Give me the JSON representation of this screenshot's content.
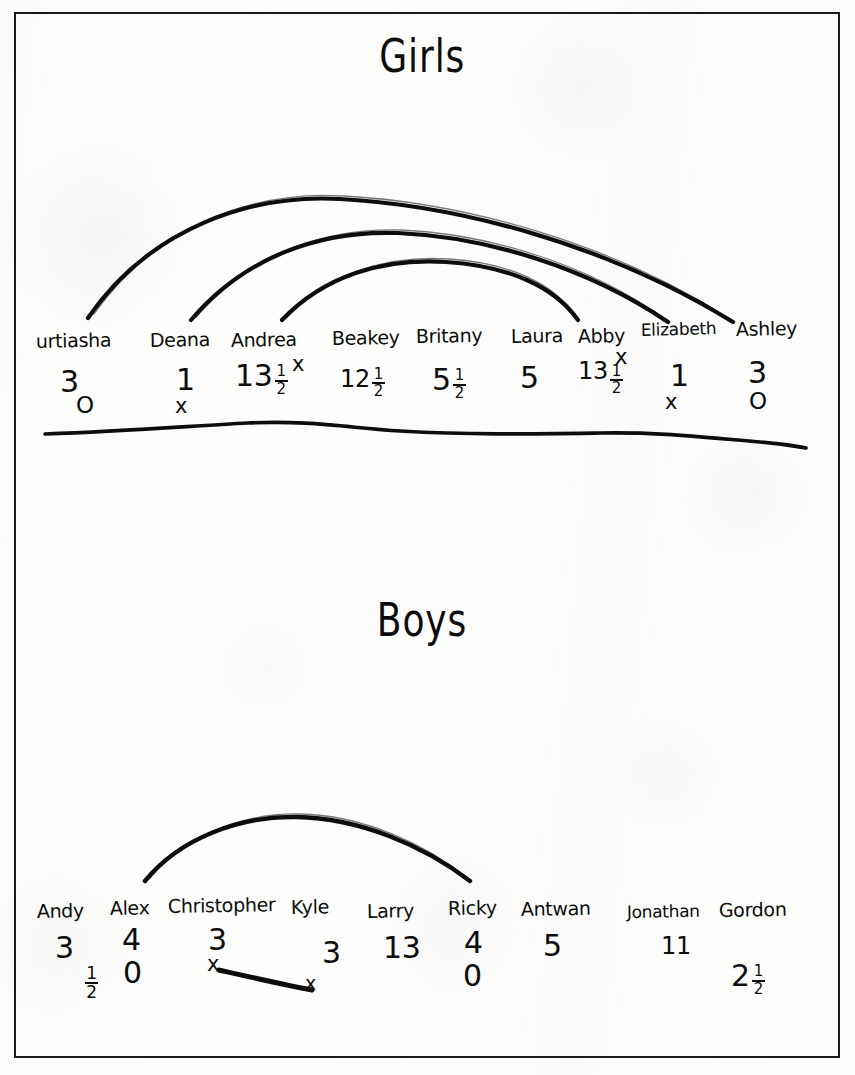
{
  "document": {
    "kind": "handwritten-worksheet",
    "ink_color": "#0d0d0d",
    "paper_color": "#fdfdfc"
  },
  "girls": {
    "title": "Girls",
    "students": [
      {
        "name": "urtiasha",
        "value": "3",
        "fraction": null,
        "below": "O",
        "mark": null
      },
      {
        "name": "Deana",
        "value": "1",
        "fraction": null,
        "below": "x",
        "mark": null
      },
      {
        "name": "Andrea",
        "value": "13",
        "fraction": "1/2",
        "below": null,
        "mark": "x"
      },
      {
        "name": "Beakey",
        "value": "12",
        "fraction": "1/2",
        "below": null,
        "mark": null
      },
      {
        "name": "Britany",
        "value": "5",
        "fraction": "1/2",
        "below": null,
        "mark": null
      },
      {
        "name": "Laura",
        "value": "5",
        "fraction": null,
        "below": null,
        "mark": null
      },
      {
        "name": "Abby",
        "value": "13",
        "fraction": "1/2",
        "below": null,
        "mark": "x"
      },
      {
        "name": "Elizabeth",
        "value": "1",
        "fraction": null,
        "below": "x",
        "mark": null
      },
      {
        "name": "Ashley",
        "value": "3",
        "fraction": null,
        "below": "O",
        "mark": null
      }
    ],
    "arcs": [
      {
        "label": "outer-arc",
        "from": "urtiasha",
        "to": "Ashley"
      },
      {
        "label": "middle-arc",
        "from": "Andrea",
        "to": "Elizabeth"
      },
      {
        "label": "inner-arc",
        "from": "Beakey",
        "to": "Abby"
      }
    ],
    "baseline": "wavy-horizontal-rule"
  },
  "boys": {
    "title": "Boys",
    "students": [
      {
        "name": "Andy",
        "value": "3",
        "fraction": "1/2",
        "below": null,
        "mark": null
      },
      {
        "name": "Alex",
        "value": "4",
        "fraction": null,
        "below": "0",
        "mark": null
      },
      {
        "name": "Christopher",
        "value": "3",
        "fraction": null,
        "below": null,
        "mark": "x"
      },
      {
        "name": "Kyle",
        "value": "3",
        "fraction": null,
        "below": null,
        "mark": "x"
      },
      {
        "name": "Larry",
        "value": "13",
        "fraction": null,
        "below": null,
        "mark": null
      },
      {
        "name": "Ricky",
        "value": "4",
        "fraction": null,
        "below": "0",
        "mark": null
      },
      {
        "name": "Antwan",
        "value": "5",
        "fraction": null,
        "below": null,
        "mark": null
      },
      {
        "name": "Jonathan",
        "value": "11",
        "fraction": null,
        "below": null,
        "mark": null
      },
      {
        "name": "Gordon",
        "value": "2",
        "fraction": "1/2",
        "below": null,
        "mark": null
      }
    ],
    "arcs": [
      {
        "label": "boys-arc",
        "from": "Alex",
        "to": "Ricky"
      }
    ],
    "connector": {
      "label": "christopher-to-kyle-line",
      "from": "Christopher",
      "to": "Kyle"
    }
  }
}
